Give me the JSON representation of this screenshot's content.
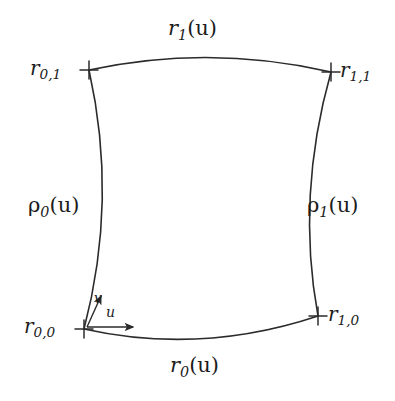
{
  "figure": {
    "kind": "coons-patch-diagram",
    "background_color": "#ffffff",
    "stroke_color": "#2b2b2b",
    "text_color": "#1c1c1c"
  },
  "boundary_labels": {
    "top": {
      "base": "r",
      "sub": "1",
      "arg": "(u)",
      "text": "r₁(u)"
    },
    "bottom": {
      "base": "r",
      "sub": "0",
      "arg": "(u)",
      "text": "r₀(u)"
    },
    "left": {
      "base": "ρ",
      "sub": "0",
      "arg": "(u)",
      "text": "ρ₀(u)"
    },
    "right": {
      "base": "ρ",
      "sub": "1",
      "arg": "(u)",
      "text": "ρ₁(u)"
    }
  },
  "corner_labels": {
    "top_left": {
      "base": "r",
      "sub": "0,1",
      "text": "r₀,₁"
    },
    "top_right": {
      "base": "r",
      "sub": "1,1",
      "text": "r₁,₁"
    },
    "bottom_left": {
      "base": "r",
      "sub": "0,0",
      "text": "r₀,₀"
    },
    "bottom_right": {
      "base": "r",
      "sub": "1,0",
      "text": "r₁,₀"
    }
  },
  "axes": {
    "u": {
      "label": "u",
      "direction": "right",
      "origin": [
        86,
        327
      ],
      "tip": [
        137,
        327
      ]
    },
    "v": {
      "label": "v",
      "direction": "up-right",
      "origin": [
        86,
        327
      ],
      "tip": [
        103,
        293
      ]
    }
  },
  "geometry": {
    "corners": {
      "top_left": [
        89,
        70
      ],
      "top_right": [
        331,
        72
      ],
      "bottom_left": [
        84,
        329
      ],
      "bottom_right": [
        318,
        316
      ]
    },
    "curves": {
      "top": {
        "from": [
          89,
          70
        ],
        "to": [
          331,
          72
        ],
        "control": [
          210,
          44
        ],
        "bow": "up"
      },
      "bottom": {
        "from": [
          84,
          329
        ],
        "to": [
          318,
          316
        ],
        "control": [
          201,
          355
        ],
        "bow": "down"
      },
      "left": {
        "from": [
          89,
          70
        ],
        "to": [
          84,
          329
        ],
        "control": [
          118,
          200
        ],
        "bow": "right"
      },
      "right": {
        "from": [
          331,
          72
        ],
        "to": [
          318,
          316
        ],
        "control": [
          296,
          196
        ],
        "bow": "left"
      }
    },
    "corner_marker": {
      "shape": "cross",
      "arm_length": 9
    }
  }
}
